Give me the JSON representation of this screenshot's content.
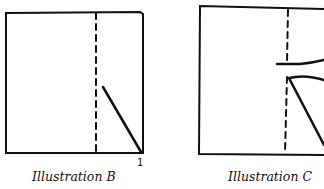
{
  "illustrations": [
    {
      "id": "B",
      "caption": "Illustration B",
      "corner_label": "1"
    },
    {
      "id": "C",
      "caption": "Illustration C"
    }
  ],
  "colors": {
    "ink": "#111111",
    "background": "#ffffff"
  }
}
